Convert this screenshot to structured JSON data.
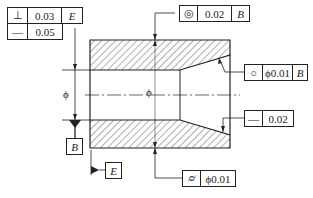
{
  "drawing": {
    "centerline_symbol": "ϕ",
    "diameter_dim_label": "ϕ",
    "frames": {
      "perpendicularity": {
        "symbol": "⊥",
        "tolerance": "0.03",
        "datum": "E"
      },
      "straightness_top": {
        "symbol": "—",
        "tolerance": "0.05"
      },
      "concentricity": {
        "symbol": "◎",
        "tolerance": "0.02",
        "datum": "B"
      },
      "circularity": {
        "symbol": "○",
        "tolerance": "ϕ0.01",
        "datum": "B"
      },
      "straightness_right": {
        "symbol": "—",
        "tolerance": "0.02"
      },
      "cylindricity": {
        "symbol": "⌭",
        "tolerance": "ϕ0.01"
      }
    },
    "datums": {
      "b": "B",
      "e": "E"
    }
  }
}
